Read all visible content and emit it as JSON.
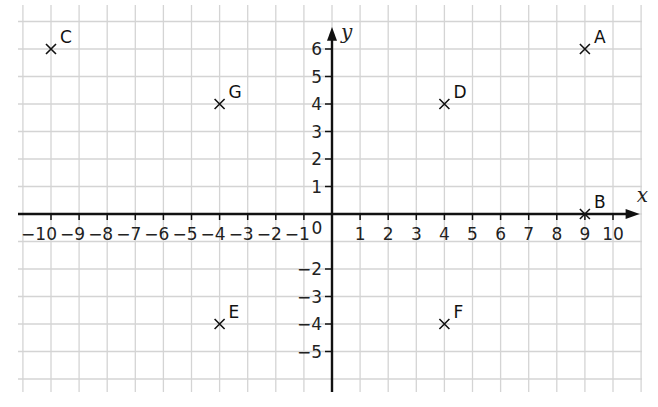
{
  "chart_data": {
    "type": "scatter",
    "title": "",
    "xlabel": "x",
    "ylabel": "y",
    "xlim": [
      -10,
      10
    ],
    "ylim": [
      -5,
      6
    ],
    "grid": true,
    "x_ticks": [
      "-10",
      "-9",
      "-8",
      "-7",
      "-6",
      "-5",
      "-4",
      "-3",
      "-2",
      "-1",
      "1",
      "2",
      "3",
      "4",
      "5",
      "6",
      "7",
      "8",
      "9",
      "10"
    ],
    "y_ticks": [
      "6",
      "5",
      "4",
      "3",
      "2",
      "1",
      "-2",
      "-3",
      "-4",
      "-5"
    ],
    "origin_label": "0",
    "points": [
      {
        "label": "A",
        "x": 9,
        "y": 6
      },
      {
        "label": "B",
        "x": 9,
        "y": 0
      },
      {
        "label": "C",
        "x": -10,
        "y": 6
      },
      {
        "label": "D",
        "x": 4,
        "y": 4
      },
      {
        "label": "E",
        "x": -4,
        "y": -4
      },
      {
        "label": "F",
        "x": 4,
        "y": -4
      },
      {
        "label": "G",
        "x": -4,
        "y": 4
      }
    ],
    "marker": "x"
  },
  "colors": {
    "grid": "#d4d4d4",
    "axis": "#111111",
    "text": "#222222"
  }
}
